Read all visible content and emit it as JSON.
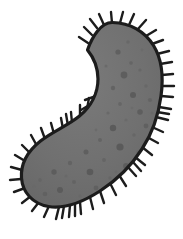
{
  "figure": {
    "title": "Ciliated microorganism",
    "caption": "",
    "canvas": {
      "width": 183,
      "height": 239,
      "background_color": "#ffffff"
    },
    "colors": {
      "background": "#ffffff",
      "body_fill": "#6f6f6f",
      "body_fill_light": "#777777",
      "outline": "#1c1c1c",
      "cilia": "#1c1c1c",
      "granule_dark": "#5d5d5d",
      "granule_darker": "#545454",
      "granule_light": "#7e7e7e"
    },
    "strokes": {
      "outline_width": 3.2,
      "cilia_width": 2.4,
      "cilia_count": 58,
      "cilia_length_min": 7,
      "cilia_length_max": 15
    },
    "parts": [
      {
        "name": "cell-body",
        "label": "Cell body"
      },
      {
        "name": "cell-membrane-outline",
        "label": "Cell membrane"
      },
      {
        "name": "cilia-fringe",
        "label": "Cilia"
      },
      {
        "name": "cytoplasm-granules",
        "label": "Cytoplasmic granules"
      }
    ],
    "body_path": "M 112.5 22.5 C 130 22.8 145 31.5 153.5 45.5 C 162.5 60 163.5 78 161 96 C 158.5 115 152.5 133 142 149 C 131.5 165.5 117 180 100 191 C 83 202 64 209 48.5 206.5 C 33 204 22.5 192.5 21.5 178 C 20.5 163.5 28.5 150.5 40.5 141 C 52.5 131.5 68 125.5 79.5 116 C 91 106.5 98 93 98 79 C 98 68 94 58 87.5 50 C 92 37 101 22.2 112.5 22.5 Z",
    "granules": [
      {
        "cx": 118,
        "cy": 52,
        "r": 2.6,
        "fill": "#5d5d5d"
      },
      {
        "cx": 131,
        "cy": 63,
        "r": 1.8,
        "fill": "#636363"
      },
      {
        "cx": 124,
        "cy": 75,
        "r": 3.4,
        "fill": "#5a5a5a"
      },
      {
        "cx": 140,
        "cy": 70,
        "r": 1.6,
        "fill": "#656565"
      },
      {
        "cx": 113,
        "cy": 88,
        "r": 2.2,
        "fill": "#606060"
      },
      {
        "cx": 133,
        "cy": 95,
        "r": 3.0,
        "fill": "#585858"
      },
      {
        "cx": 146,
        "cy": 86,
        "r": 1.7,
        "fill": "#666666"
      },
      {
        "cx": 120,
        "cy": 104,
        "r": 1.9,
        "fill": "#646464"
      },
      {
        "cx": 140,
        "cy": 112,
        "r": 2.8,
        "fill": "#5b5b5b"
      },
      {
        "cx": 126,
        "cy": 120,
        "r": 1.5,
        "fill": "#686868"
      },
      {
        "cx": 150,
        "cy": 100,
        "r": 2.1,
        "fill": "#616161"
      },
      {
        "cx": 113,
        "cy": 128,
        "r": 3.2,
        "fill": "#575757"
      },
      {
        "cx": 134,
        "cy": 135,
        "r": 1.8,
        "fill": "#656565"
      },
      {
        "cx": 146,
        "cy": 126,
        "r": 2.4,
        "fill": "#5e5e5e"
      },
      {
        "cx": 100,
        "cy": 140,
        "r": 2.0,
        "fill": "#626262"
      },
      {
        "cx": 120,
        "cy": 147,
        "r": 3.6,
        "fill": "#565656"
      },
      {
        "cx": 138,
        "cy": 152,
        "r": 1.7,
        "fill": "#666666"
      },
      {
        "cx": 86,
        "cy": 152,
        "r": 2.5,
        "fill": "#5c5c5c"
      },
      {
        "cx": 104,
        "cy": 160,
        "r": 1.9,
        "fill": "#636363"
      },
      {
        "cx": 126,
        "cy": 166,
        "r": 2.9,
        "fill": "#595959"
      },
      {
        "cx": 70,
        "cy": 163,
        "r": 2.2,
        "fill": "#606060"
      },
      {
        "cx": 90,
        "cy": 172,
        "r": 3.3,
        "fill": "#575757"
      },
      {
        "cx": 110,
        "cy": 178,
        "r": 1.8,
        "fill": "#656565"
      },
      {
        "cx": 54,
        "cy": 172,
        "r": 2.7,
        "fill": "#5b5b5b"
      },
      {
        "cx": 74,
        "cy": 182,
        "r": 2.0,
        "fill": "#626262"
      },
      {
        "cx": 96,
        "cy": 188,
        "r": 2.4,
        "fill": "#5e5e5e"
      },
      {
        "cx": 40,
        "cy": 180,
        "r": 1.9,
        "fill": "#646464"
      },
      {
        "cx": 60,
        "cy": 190,
        "r": 3.0,
        "fill": "#585858"
      },
      {
        "cx": 80,
        "cy": 196,
        "r": 1.6,
        "fill": "#676767"
      },
      {
        "cx": 45,
        "cy": 194,
        "r": 2.3,
        "fill": "#5f5f5f"
      },
      {
        "cx": 66,
        "cy": 176,
        "r": 1.5,
        "fill": "#696969"
      },
      {
        "cx": 108,
        "cy": 113,
        "r": 1.6,
        "fill": "#676767"
      },
      {
        "cx": 152,
        "cy": 113,
        "r": 1.5,
        "fill": "#686868"
      },
      {
        "cx": 128,
        "cy": 42,
        "r": 1.7,
        "fill": "#666666"
      },
      {
        "cx": 142,
        "cy": 50,
        "r": 1.4,
        "fill": "#6a6a6a"
      },
      {
        "cx": 106,
        "cy": 66,
        "r": 1.5,
        "fill": "#696969"
      },
      {
        "cx": 34,
        "cy": 186,
        "r": 1.5,
        "fill": "#696969"
      },
      {
        "cx": 116,
        "cy": 172,
        "r": 1.4,
        "fill": "#6a6a6a"
      },
      {
        "cx": 132,
        "cy": 108,
        "r": 1.3,
        "fill": "#6b6b6b"
      },
      {
        "cx": 96,
        "cy": 130,
        "r": 1.4,
        "fill": "#6a6a6a"
      }
    ],
    "cilia": [
      {
        "x1": 112,
        "y1": 23,
        "x2": 111,
        "y2": 12
      },
      {
        "x1": 104,
        "y1": 25,
        "x2": 99,
        "y2": 14
      },
      {
        "x1": 120,
        "y1": 23,
        "x2": 123,
        "y2": 12
      },
      {
        "x1": 129,
        "y1": 25,
        "x2": 134,
        "y2": 14
      },
      {
        "x1": 138,
        "y1": 29,
        "x2": 146,
        "y2": 20
      },
      {
        "x1": 146,
        "y1": 36,
        "x2": 156,
        "y2": 30
      },
      {
        "x1": 152,
        "y1": 44,
        "x2": 163,
        "y2": 40
      },
      {
        "x1": 157,
        "y1": 54,
        "x2": 169,
        "y2": 51
      },
      {
        "x1": 160,
        "y1": 64,
        "x2": 172,
        "y2": 62
      },
      {
        "x1": 162,
        "y1": 75,
        "x2": 173,
        "y2": 74
      },
      {
        "x1": 162,
        "y1": 86,
        "x2": 174,
        "y2": 86
      },
      {
        "x1": 161,
        "y1": 96,
        "x2": 173,
        "y2": 97
      },
      {
        "x1": 159,
        "y1": 107,
        "x2": 171,
        "y2": 109
      },
      {
        "x1": 156,
        "y1": 117,
        "x2": 168,
        "y2": 120
      },
      {
        "x1": 152,
        "y1": 127,
        "x2": 163,
        "y2": 132
      },
      {
        "x1": 147,
        "y1": 137,
        "x2": 158,
        "y2": 143
      },
      {
        "x1": 142,
        "y1": 147,
        "x2": 152,
        "y2": 155
      },
      {
        "x1": 135,
        "y1": 157,
        "x2": 145,
        "y2": 165
      },
      {
        "x1": 127,
        "y1": 166,
        "x2": 136,
        "y2": 176
      },
      {
        "x1": 119,
        "y1": 175,
        "x2": 126,
        "y2": 186
      },
      {
        "x1": 110,
        "y1": 183,
        "x2": 116,
        "y2": 195
      },
      {
        "x1": 100,
        "y1": 191,
        "x2": 104,
        "y2": 203
      },
      {
        "x1": 90,
        "y1": 197,
        "x2": 93,
        "y2": 209
      },
      {
        "x1": 80,
        "y1": 202,
        "x2": 81,
        "y2": 214
      },
      {
        "x1": 70,
        "y1": 205,
        "x2": 69,
        "y2": 217
      },
      {
        "x1": 59,
        "y1": 207,
        "x2": 56,
        "y2": 219
      },
      {
        "x1": 49,
        "y1": 206,
        "x2": 44,
        "y2": 217
      },
      {
        "x1": 39,
        "y1": 202,
        "x2": 32,
        "y2": 211
      },
      {
        "x1": 31,
        "y1": 196,
        "x2": 22,
        "y2": 203
      },
      {
        "x1": 25,
        "y1": 188,
        "x2": 14,
        "y2": 192
      },
      {
        "x1": 21,
        "y1": 179,
        "x2": 10,
        "y2": 180
      },
      {
        "x1": 22,
        "y1": 170,
        "x2": 11,
        "y2": 167
      },
      {
        "x1": 25,
        "y1": 161,
        "x2": 15,
        "y2": 155
      },
      {
        "x1": 30,
        "y1": 153,
        "x2": 22,
        "y2": 145
      },
      {
        "x1": 37,
        "y1": 146,
        "x2": 31,
        "y2": 135
      },
      {
        "x1": 45,
        "y1": 139,
        "x2": 41,
        "y2": 128
      },
      {
        "x1": 54,
        "y1": 134,
        "x2": 51,
        "y2": 123
      },
      {
        "x1": 63,
        "y1": 129,
        "x2": 61,
        "y2": 118
      },
      {
        "x1": 72,
        "y1": 123,
        "x2": 71,
        "y2": 112
      },
      {
        "x1": 80,
        "y1": 116,
        "x2": 80,
        "y2": 105
      },
      {
        "x1": 87,
        "y1": 109,
        "x2": 89,
        "y2": 98
      },
      {
        "x1": 93,
        "y1": 100,
        "x2": 97,
        "y2": 90
      },
      {
        "x1": 96,
        "y1": 91,
        "x2": 107,
        "y2": 88
      },
      {
        "x1": 98,
        "y1": 81,
        "x2": 109,
        "y2": 78
      },
      {
        "x1": 97,
        "y1": 71,
        "x2": 108,
        "y2": 67
      },
      {
        "x1": 94,
        "y1": 61,
        "x2": 104,
        "y2": 55
      },
      {
        "x1": 90,
        "y1": 52,
        "x2": 99,
        "y2": 45
      },
      {
        "x1": 88,
        "y1": 43,
        "x2": 79,
        "y2": 37
      },
      {
        "x1": 92,
        "y1": 35,
        "x2": 84,
        "y2": 27
      },
      {
        "x1": 97,
        "y1": 28,
        "x2": 90,
        "y2": 19
      },
      {
        "x1": 96,
        "y1": 96,
        "x2": 85,
        "y2": 100
      },
      {
        "x1": 91,
        "y1": 104,
        "x2": 81,
        "y2": 110
      },
      {
        "x1": 85,
        "y1": 112,
        "x2": 76,
        "y2": 119
      },
      {
        "x1": 68,
        "y1": 126,
        "x2": 66,
        "y2": 114
      },
      {
        "x1": 133,
        "y1": 162,
        "x2": 141,
        "y2": 171
      },
      {
        "x1": 75,
        "y1": 204,
        "x2": 75,
        "y2": 216
      },
      {
        "x1": 64,
        "y1": 206,
        "x2": 62,
        "y2": 218
      },
      {
        "x1": 157,
        "y1": 112,
        "x2": 169,
        "y2": 114
      }
    ]
  }
}
